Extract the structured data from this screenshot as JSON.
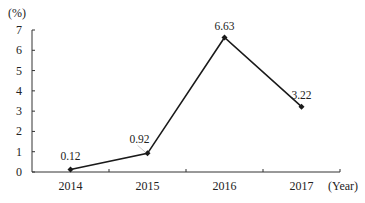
{
  "chart_data": {
    "type": "line",
    "title": "",
    "xlabel": "(Year)",
    "ylabel": "(%)",
    "categories": [
      "2014",
      "2015",
      "2016",
      "2017"
    ],
    "series": [
      {
        "name": "Rate",
        "values": [
          0.12,
          0.92,
          6.63,
          3.22
        ]
      }
    ],
    "data_labels": [
      "0.12",
      "0.92",
      "6.63",
      "3.22"
    ],
    "y_ticks": [
      "0",
      "1",
      "2",
      "3",
      "4",
      "5",
      "6",
      "7"
    ],
    "ylim": [
      0,
      7
    ],
    "grid": false,
    "legend": "none",
    "colors": {
      "line": "#1a1a1a",
      "axis": "#333333",
      "text": "#222222"
    }
  }
}
